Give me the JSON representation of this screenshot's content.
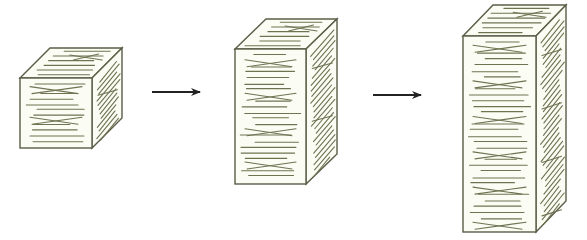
{
  "figure": {
    "type": "growth-sequence",
    "colors": {
      "background": "#ffffff",
      "face_fill": "#fbfcf3",
      "edge": "#5b5d48",
      "hatch": "#6f7352",
      "arrow": "#222222"
    },
    "blocks": [
      {
        "name": "block-small",
        "front": {
          "x": 20,
          "y": 78,
          "w": 72,
          "h": 70
        },
        "depth": {
          "dx": 30,
          "dy": -30
        },
        "hatch_rows": 12,
        "side_rows": 12,
        "top_rows": 6
      },
      {
        "name": "block-medium",
        "front": {
          "x": 235,
          "y": 49,
          "w": 71,
          "h": 135
        },
        "depth": {
          "dx": 31,
          "dy": -30
        },
        "hatch_rows": 22,
        "side_rows": 22,
        "top_rows": 6
      },
      {
        "name": "block-large",
        "front": {
          "x": 463,
          "y": 36,
          "w": 73,
          "h": 196
        },
        "depth": {
          "dx": 30,
          "dy": -31
        },
        "hatch_rows": 32,
        "side_rows": 32,
        "top_rows": 6
      }
    ],
    "arrows": [
      {
        "name": "arrow-1",
        "x1": 152,
        "x2": 200,
        "y": 92
      },
      {
        "name": "arrow-2",
        "x1": 373,
        "x2": 421,
        "y": 95
      }
    ]
  }
}
